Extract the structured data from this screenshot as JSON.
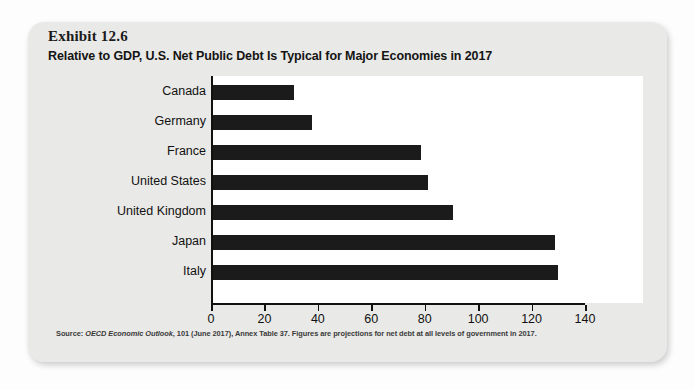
{
  "exhibit": {
    "number": "Exhibit 12.6",
    "title": "Relative to GDP, U.S. Net Public Debt Is Typical for Major Economies in 2017"
  },
  "source": {
    "prefix": "Source:",
    "italic_part": "OECD Economic Outlook",
    "rest": ", 101 (June 2017), Annex Table 37. Figures are projections for net debt at all levels of government in 2017."
  },
  "chart_data": {
    "type": "bar",
    "orientation": "horizontal",
    "title": "Relative to GDP, U.S. Net Public Debt Is Typical for Major Economies in 2017",
    "xlabel": "",
    "ylabel": "",
    "xlim": [
      0,
      140
    ],
    "xticks": [
      0,
      20,
      40,
      60,
      80,
      100,
      120,
      140
    ],
    "xtick_labels": [
      "0",
      "20",
      "40",
      "60",
      "80",
      "100",
      "120",
      "140"
    ],
    "grid": false,
    "legend": false,
    "bar_color": "#1b1b1b",
    "categories": [
      "Canada",
      "Germany",
      "France",
      "United States",
      "United Kingdom",
      "Japan",
      "Italy"
    ],
    "values": [
      30.5,
      37,
      78,
      80.5,
      90,
      128,
      129
    ]
  }
}
